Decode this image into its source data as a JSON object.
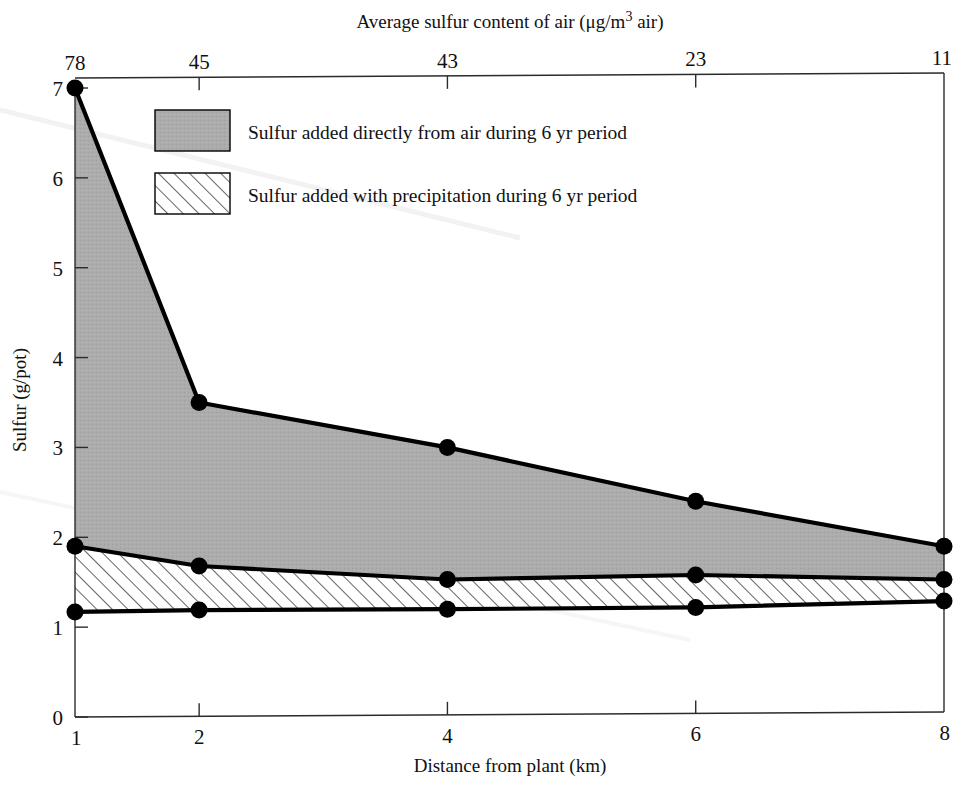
{
  "figure": {
    "background": "#ffffff",
    "ink": "#000000",
    "fill_gray": "#a9a9a9",
    "hatch_stroke": "#555555"
  },
  "top_axis": {
    "title_prefix": "Average sulfur content of air (",
    "title_mu": "μg/m",
    "title_sup": "3",
    "title_suffix": " air)",
    "ticks": [
      "78",
      "45",
      "43",
      "23",
      "11"
    ]
  },
  "bottom_axis": {
    "title": "Distance from plant (km)",
    "ticks": [
      "1",
      "2",
      "4",
      "6",
      "8"
    ]
  },
  "left_axis": {
    "title": "Sulfur (g/pot)",
    "ticks": [
      "0",
      "1",
      "2",
      "3",
      "4",
      "5",
      "6",
      "7"
    ]
  },
  "legend": {
    "items": [
      {
        "swatch": "solid-gray",
        "label": "Sulfur added directly from air during 6 yr period"
      },
      {
        "swatch": "hatched",
        "label": "Sulfur added with precipitation during 6 yr period"
      }
    ]
  },
  "chart_data": {
    "type": "area",
    "title": "",
    "xlabel": "Distance from plant (km)",
    "ylabel": "Sulfur (g/pot)",
    "x": [
      1,
      2,
      4,
      6,
      8
    ],
    "x_top_labels": [
      78,
      45,
      43,
      23,
      11
    ],
    "x_top_label_axis": "Average sulfur content of air (μg/m3 air)",
    "xlim": [
      1,
      8
    ],
    "ylim": [
      0,
      7
    ],
    "grid": false,
    "legend_position": "upper-center-inside",
    "series": [
      {
        "name": "Total sulfur (upper boundary)",
        "values": [
          7.0,
          3.5,
          3.0,
          2.4,
          1.9
        ],
        "marker": "filled-circle"
      },
      {
        "name": "Sulfur added with precipitation (upper boundary of hatched band)",
        "values": [
          1.9,
          1.68,
          1.53,
          1.58,
          1.53
        ],
        "marker": "filled-circle"
      },
      {
        "name": "Baseline (lower boundary of hatched band)",
        "values": [
          1.17,
          1.19,
          1.2,
          1.22,
          1.29
        ],
        "marker": "filled-circle"
      }
    ],
    "bands": [
      {
        "name": "Sulfur added directly from air during 6 yr period",
        "fill": "solid-gray",
        "between": [
          "Total sulfur (upper boundary)",
          "Sulfur added with precipitation (upper boundary of hatched band)"
        ]
      },
      {
        "name": "Sulfur added with precipitation during 6 yr period",
        "fill": "hatched",
        "between": [
          "Sulfur added with precipitation (upper boundary of hatched band)",
          "Baseline (lower boundary of hatched band)"
        ]
      }
    ]
  }
}
